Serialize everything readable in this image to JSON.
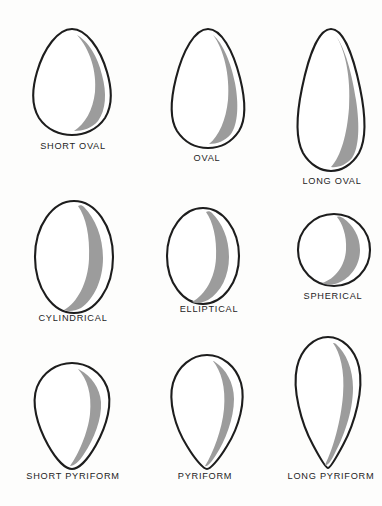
{
  "figure": {
    "background_color": "#fdfdfc",
    "outline_color": "#1d1d1d",
    "shading_color": "#9c9c9c",
    "label_color": "#242424",
    "rows": 3,
    "columns": 3
  },
  "shapes": [
    {
      "id": "short-oval",
      "label": "SHORT  OVAL",
      "row": 1,
      "column": 1,
      "form": "ovoid",
      "orientation": "narrow-end-up",
      "width_px": 86,
      "height_px": 108,
      "label_x": 28,
      "label_y": 141,
      "label_width": 90
    },
    {
      "id": "oval",
      "label": "OVAL",
      "row": 1,
      "column": 2,
      "form": "ovoid",
      "orientation": "narrow-end-up",
      "width_px": 84,
      "height_px": 121,
      "label_x": 162,
      "label_y": 153,
      "label_width": 90
    },
    {
      "id": "long-oval",
      "label": "LONG  OVAL",
      "row": 1,
      "column": 3,
      "form": "ovoid",
      "orientation": "narrow-end-up",
      "width_px": 80,
      "height_px": 144,
      "label_x": 287,
      "label_y": 176,
      "label_width": 90
    },
    {
      "id": "cylindrical",
      "label": "CYLINDRICAL",
      "row": 2,
      "column": 1,
      "form": "ellipse",
      "orientation": "symmetric",
      "width_px": 82,
      "height_px": 116,
      "label_x": 21,
      "label_y": 313,
      "label_width": 104
    },
    {
      "id": "elliptical",
      "label": "ELLIPTICAL",
      "row": 2,
      "column": 2,
      "form": "ellipse",
      "orientation": "symmetric",
      "width_px": 76,
      "height_px": 98,
      "label_x": 163,
      "label_y": 304,
      "label_width": 92
    },
    {
      "id": "spherical",
      "label": "SPHERICAL",
      "row": 2,
      "column": 3,
      "form": "circle",
      "orientation": "symmetric",
      "width_px": 76,
      "height_px": 78,
      "label_x": 290,
      "label_y": 291,
      "label_width": 86
    },
    {
      "id": "short-pyriform",
      "label": "SHORT PYRIFORM",
      "row": 3,
      "column": 1,
      "form": "pyriform",
      "orientation": "pointed-end-down",
      "width_px": 86,
      "height_px": 108,
      "label_x": 14,
      "label_y": 471,
      "label_width": 118
    },
    {
      "id": "pyriform",
      "label": "PYRIFORM",
      "row": 3,
      "column": 2,
      "form": "pyriform",
      "orientation": "pointed-end-down",
      "width_px": 82,
      "height_px": 116,
      "label_x": 160,
      "label_y": 471,
      "label_width": 90
    },
    {
      "id": "long-pyriform",
      "label": "LONG PYRIFORM",
      "row": 3,
      "column": 3,
      "form": "pyriform",
      "orientation": "pointed-end-down",
      "width_px": 76,
      "height_px": 134,
      "label_x": 275,
      "label_y": 471,
      "label_width": 112
    }
  ]
}
